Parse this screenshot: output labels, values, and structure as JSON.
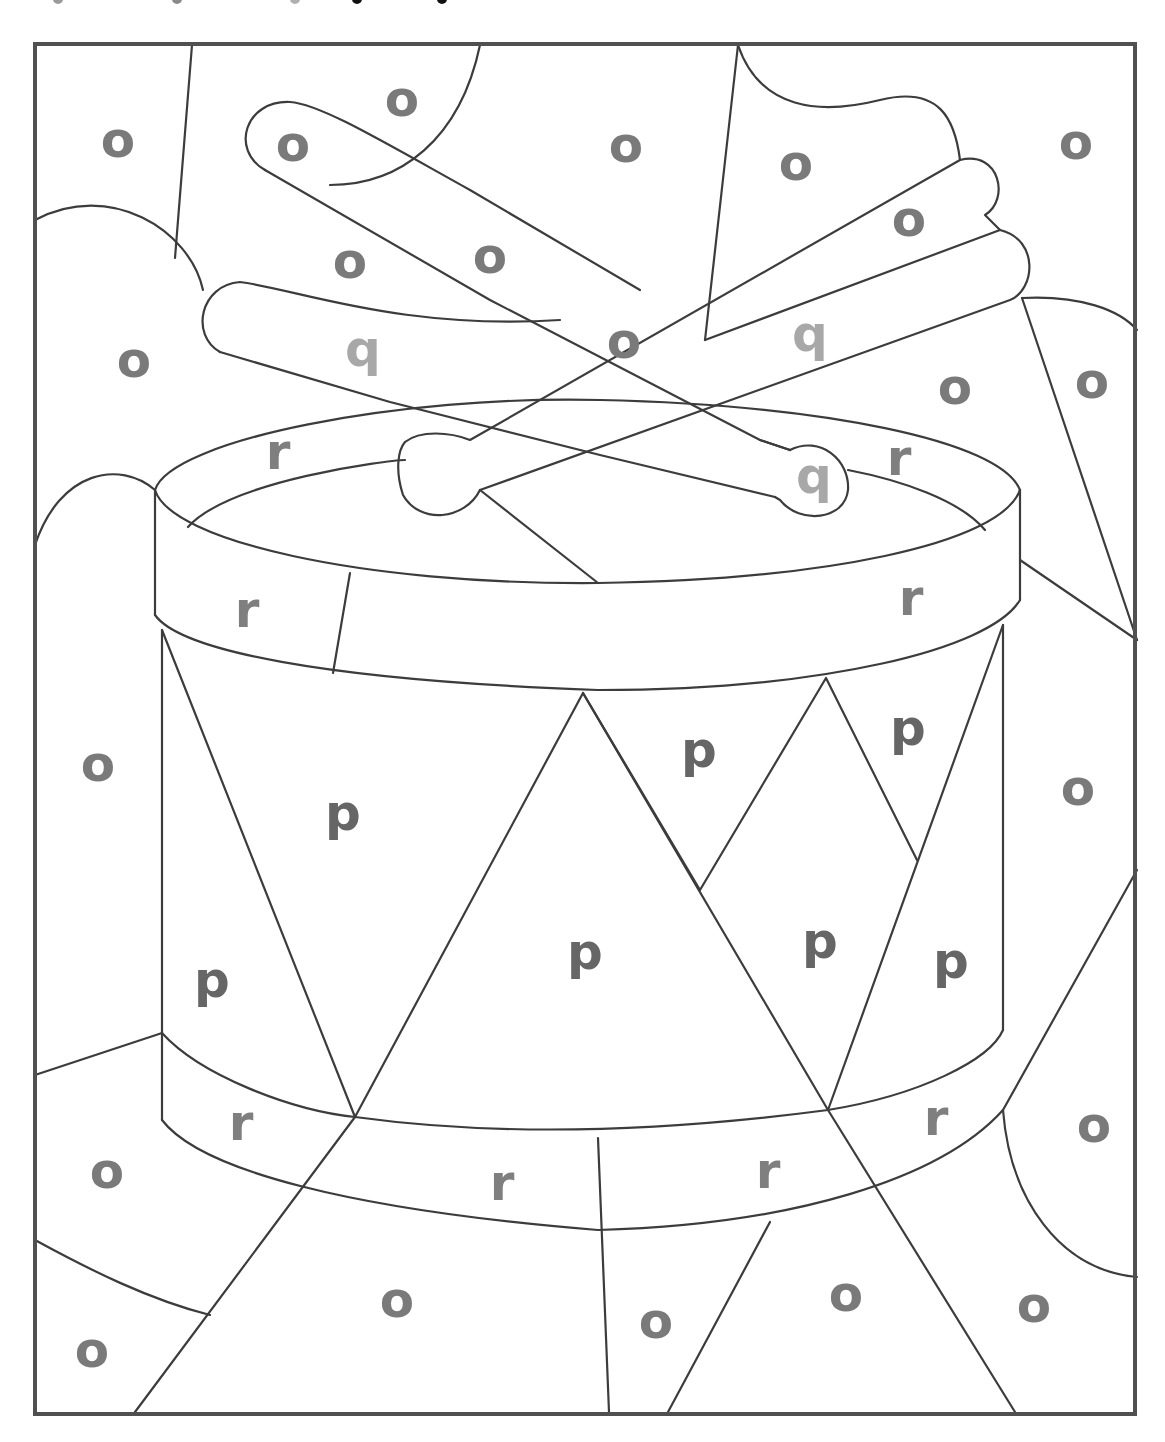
{
  "worksheet": {
    "title_fragment": "(cut off heading at top of page)",
    "subject": "drum with crossed drumsticks",
    "letter_colors": {
      "o": "#7a7a7a",
      "p": "#666666",
      "q": "#a8a8a8",
      "r": "#7f7f7f"
    },
    "frame_color": "#505050",
    "line_color": "#3c3c3c"
  },
  "letters": [
    {
      "ch": "o",
      "x": 118,
      "y": 142
    },
    {
      "ch": "o",
      "x": 293,
      "y": 146
    },
    {
      "ch": "o",
      "x": 402,
      "y": 101
    },
    {
      "ch": "o",
      "x": 626,
      "y": 147
    },
    {
      "ch": "o",
      "x": 796,
      "y": 165
    },
    {
      "ch": "o",
      "x": 1076,
      "y": 144
    },
    {
      "ch": "o",
      "x": 350,
      "y": 263
    },
    {
      "ch": "o",
      "x": 490,
      "y": 258
    },
    {
      "ch": "o",
      "x": 909,
      "y": 221
    },
    {
      "ch": "o",
      "x": 624,
      "y": 343
    },
    {
      "ch": "o",
      "x": 134,
      "y": 362
    },
    {
      "ch": "o",
      "x": 955,
      "y": 389
    },
    {
      "ch": "o",
      "x": 1092,
      "y": 383
    },
    {
      "ch": "q",
      "x": 363,
      "y": 351
    },
    {
      "ch": "q",
      "x": 810,
      "y": 336
    },
    {
      "ch": "q",
      "x": 814,
      "y": 478
    },
    {
      "ch": "r",
      "x": 278,
      "y": 454
    },
    {
      "ch": "r",
      "x": 899,
      "y": 460
    },
    {
      "ch": "r",
      "x": 247,
      "y": 612
    },
    {
      "ch": "r",
      "x": 911,
      "y": 600
    },
    {
      "ch": "o",
      "x": 98,
      "y": 766
    },
    {
      "ch": "p",
      "x": 343,
      "y": 815
    },
    {
      "ch": "p",
      "x": 699,
      "y": 752
    },
    {
      "ch": "p",
      "x": 908,
      "y": 730
    },
    {
      "ch": "o",
      "x": 1078,
      "y": 790
    },
    {
      "ch": "p",
      "x": 212,
      "y": 982
    },
    {
      "ch": "p",
      "x": 585,
      "y": 954
    },
    {
      "ch": "p",
      "x": 820,
      "y": 943
    },
    {
      "ch": "p",
      "x": 951,
      "y": 963
    },
    {
      "ch": "r",
      "x": 241,
      "y": 1125
    },
    {
      "ch": "r",
      "x": 936,
      "y": 1120
    },
    {
      "ch": "o",
      "x": 1094,
      "y": 1127
    },
    {
      "ch": "o",
      "x": 107,
      "y": 1173
    },
    {
      "ch": "r",
      "x": 502,
      "y": 1185
    },
    {
      "ch": "r",
      "x": 768,
      "y": 1173
    },
    {
      "ch": "o",
      "x": 397,
      "y": 1302
    },
    {
      "ch": "o",
      "x": 846,
      "y": 1296
    },
    {
      "ch": "o",
      "x": 1034,
      "y": 1307
    },
    {
      "ch": "o",
      "x": 656,
      "y": 1323
    },
    {
      "ch": "o",
      "x": 92,
      "y": 1352
    }
  ]
}
